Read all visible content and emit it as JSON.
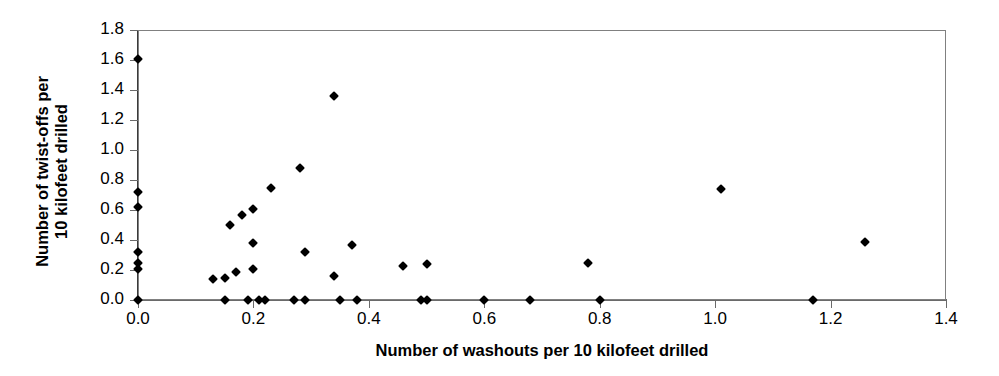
{
  "chart_data": {
    "type": "scatter",
    "title": "",
    "xlabel": "Number of washouts per 10 kilofeet drilled",
    "ylabel": "Number of twist-offs per\n10 kilofeet drilled",
    "xlim": [
      0.0,
      1.4
    ],
    "ylim": [
      0.0,
      1.8
    ],
    "xticks": [
      0.0,
      0.2,
      0.4,
      0.6,
      0.8,
      1.0,
      1.2,
      1.4
    ],
    "xticklabels": [
      "0.0",
      "0.2",
      "0.4",
      "0.6",
      "0.8",
      "1.0",
      "1.2",
      "1.4"
    ],
    "yticks": [
      0.0,
      0.2,
      0.4,
      0.6,
      0.8,
      1.0,
      1.2,
      1.4,
      1.6,
      1.8
    ],
    "yticklabels": [
      "0.0",
      "0.2",
      "0.4",
      "0.6",
      "0.8",
      "1.0",
      "1.2",
      "1.4",
      "1.6",
      "1.8"
    ],
    "grid": false,
    "legend": null,
    "marker": "diamond",
    "marker_color": "#000000",
    "frame_color": "#808080",
    "points": [
      {
        "x": 0.0,
        "y": 1.61
      },
      {
        "x": 0.0,
        "y": 0.72
      },
      {
        "x": 0.0,
        "y": 0.62
      },
      {
        "x": 0.0,
        "y": 0.32
      },
      {
        "x": 0.0,
        "y": 0.25
      },
      {
        "x": 0.0,
        "y": 0.21
      },
      {
        "x": 0.0,
        "y": 0.0
      },
      {
        "x": 0.13,
        "y": 0.14
      },
      {
        "x": 0.15,
        "y": 0.15
      },
      {
        "x": 0.15,
        "y": 0.0
      },
      {
        "x": 0.16,
        "y": 0.5
      },
      {
        "x": 0.17,
        "y": 0.19
      },
      {
        "x": 0.18,
        "y": 0.57
      },
      {
        "x": 0.19,
        "y": 0.0
      },
      {
        "x": 0.2,
        "y": 0.61
      },
      {
        "x": 0.2,
        "y": 0.38
      },
      {
        "x": 0.2,
        "y": 0.21
      },
      {
        "x": 0.21,
        "y": 0.0
      },
      {
        "x": 0.22,
        "y": 0.0
      },
      {
        "x": 0.23,
        "y": 0.75
      },
      {
        "x": 0.27,
        "y": 0.0
      },
      {
        "x": 0.28,
        "y": 0.88
      },
      {
        "x": 0.29,
        "y": 0.32
      },
      {
        "x": 0.29,
        "y": 0.0
      },
      {
        "x": 0.34,
        "y": 1.36
      },
      {
        "x": 0.34,
        "y": 0.16
      },
      {
        "x": 0.35,
        "y": 0.0
      },
      {
        "x": 0.37,
        "y": 0.37
      },
      {
        "x": 0.38,
        "y": 0.0
      },
      {
        "x": 0.46,
        "y": 0.23
      },
      {
        "x": 0.49,
        "y": 0.0
      },
      {
        "x": 0.5,
        "y": 0.0
      },
      {
        "x": 0.5,
        "y": 0.24
      },
      {
        "x": 0.6,
        "y": 0.0
      },
      {
        "x": 0.68,
        "y": 0.0
      },
      {
        "x": 0.78,
        "y": 0.25
      },
      {
        "x": 0.8,
        "y": 0.0
      },
      {
        "x": 1.01,
        "y": 0.74
      },
      {
        "x": 1.17,
        "y": 0.0
      },
      {
        "x": 1.26,
        "y": 0.39
      }
    ]
  }
}
